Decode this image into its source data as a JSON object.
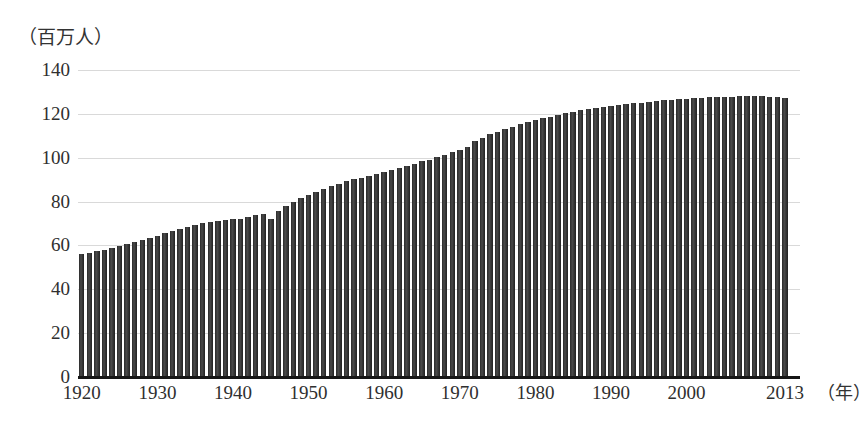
{
  "chart_data": {
    "type": "bar",
    "title": "",
    "subtitle": "",
    "xlabel": "（年）",
    "ylabel": "（百万人）",
    "ylim": [
      0,
      140
    ],
    "xlim": [
      1920,
      2013
    ],
    "grid": true,
    "legend": "none",
    "y_ticks": [
      0,
      20,
      40,
      60,
      80,
      100,
      120,
      140
    ],
    "y_tick_labels": [
      "0",
      "20",
      "40",
      "60",
      "80",
      "100",
      "120",
      "140"
    ],
    "x_ticks": [
      1920,
      1930,
      1940,
      1950,
      1960,
      1970,
      1980,
      1990,
      2000,
      2013
    ],
    "x_tick_labels": [
      "1920",
      "1930",
      "1940",
      "1950",
      "1960",
      "1970",
      "1980",
      "1990",
      "2000",
      "2013"
    ],
    "bar_color": "#3a3a3a",
    "gridline_color": "#d9d9d9",
    "axis_color": "#161616",
    "series_name": "総人口",
    "x": [
      1920,
      1921,
      1922,
      1923,
      1924,
      1925,
      1926,
      1927,
      1928,
      1929,
      1930,
      1931,
      1932,
      1933,
      1934,
      1935,
      1936,
      1937,
      1938,
      1939,
      1940,
      1941,
      1942,
      1943,
      1944,
      1945,
      1946,
      1947,
      1948,
      1949,
      1950,
      1951,
      1952,
      1953,
      1954,
      1955,
      1956,
      1957,
      1958,
      1959,
      1960,
      1961,
      1962,
      1963,
      1964,
      1965,
      1966,
      1967,
      1968,
      1969,
      1970,
      1971,
      1972,
      1973,
      1974,
      1975,
      1976,
      1977,
      1978,
      1979,
      1980,
      1981,
      1982,
      1983,
      1984,
      1985,
      1986,
      1987,
      1988,
      1989,
      1990,
      1991,
      1992,
      1993,
      1994,
      1995,
      1996,
      1997,
      1998,
      1999,
      2000,
      2001,
      2002,
      2003,
      2004,
      2005,
      2006,
      2007,
      2008,
      2009,
      2010,
      2011,
      2012,
      2013
    ],
    "values": [
      55.9,
      56.7,
      57.4,
      58.1,
      58.9,
      59.7,
      60.7,
      61.7,
      62.6,
      63.5,
      64.5,
      65.5,
      66.4,
      67.4,
      68.3,
      69.3,
      70.1,
      70.6,
      71.0,
      71.4,
      71.9,
      72.2,
      72.9,
      73.9,
      74.4,
      72.1,
      75.8,
      78.1,
      80.0,
      81.8,
      83.2,
      84.5,
      85.8,
      87.0,
      88.2,
      89.3,
      90.2,
      90.9,
      91.8,
      92.6,
      93.4,
      94.3,
      95.2,
      96.2,
      97.2,
      98.3,
      99.0,
      100.2,
      101.3,
      102.5,
      103.7,
      105.1,
      107.6,
      109.1,
      110.6,
      111.9,
      113.1,
      114.2,
      115.2,
      116.1,
      117.1,
      117.9,
      118.7,
      119.5,
      120.2,
      121.0,
      121.7,
      122.3,
      122.8,
      123.2,
      123.6,
      124.1,
      124.5,
      124.8,
      125.0,
      125.6,
      125.9,
      126.2,
      126.5,
      126.7,
      126.9,
      127.3,
      127.4,
      127.6,
      127.7,
      127.8,
      127.8,
      128.0,
      128.1,
      128.0,
      128.1,
      127.8,
      127.6,
      127.3
    ]
  },
  "figure": {
    "y_unit_caption": "（百万人）",
    "x_unit_caption": "（年）"
  }
}
